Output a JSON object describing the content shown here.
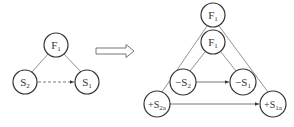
{
  "left_diagram": {
    "nodes": {
      "f1": {
        "main": "F",
        "sub": "1"
      },
      "s2": {
        "main": "S",
        "sub": "2"
      },
      "s1": {
        "main": "S",
        "sub": "1"
      }
    },
    "edges": [
      "F1-S2 solid",
      "F1-S1 solid",
      "S2->S1 dashed arrow"
    ]
  },
  "transform_arrow": "hollow right arrow",
  "right_diagram": {
    "nodes": {
      "f1_outer": {
        "main": "F",
        "sub": "1"
      },
      "f1_inner": {
        "main": "F",
        "sub": "1"
      },
      "neg_s2": {
        "main": "−S",
        "sub": "2"
      },
      "neg_s1": {
        "main": "−S",
        "sub": "1"
      },
      "pos_s2a": {
        "main": "+S",
        "sub": "2a"
      },
      "pos_s1a": {
        "main": "+S",
        "sub": "1a"
      }
    },
    "edges": [
      "F1outer-+S2a",
      "F1outer-+S1a",
      "F1inner-−S2",
      "F1inner-−S1",
      "−S2->−S1 arrow",
      "+S2a->+S1a arrow"
    ]
  },
  "colors": {
    "stroke": "#333333",
    "line": "#666666"
  }
}
